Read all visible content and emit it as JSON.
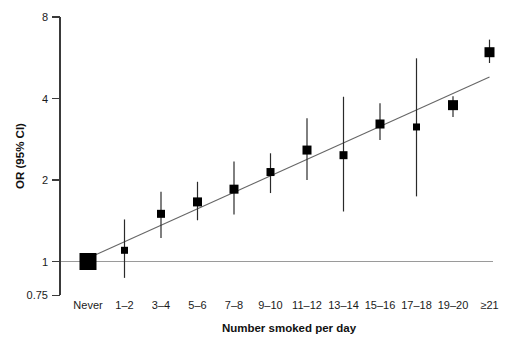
{
  "chart_data": {
    "type": "scatter",
    "subtype": "forest-plot",
    "title": "",
    "xlabel": "Number smoked per day",
    "ylabel": "OR (95% CI)",
    "y_scale": "log",
    "ylim": [
      0.75,
      8
    ],
    "y_ticks": [
      8,
      4,
      2,
      1,
      0.75
    ],
    "y_tick_labels": [
      "8",
      "4",
      "2",
      "1",
      "0.75"
    ],
    "grid": false,
    "legend": false,
    "categories": [
      "Never",
      "1–2",
      "3–4",
      "5–6",
      "7–8",
      "9–10",
      "11–12",
      "13–14",
      "15–16",
      "17–18",
      "19–20",
      "≥21"
    ],
    "points": [
      {
        "category": "Never",
        "or": 1.0,
        "ci_low": null,
        "ci_high": null,
        "marker_px": 17
      },
      {
        "category": "1–2",
        "or": 1.1,
        "ci_low": 0.87,
        "ci_high": 1.43,
        "marker_px": 7
      },
      {
        "category": "3–4",
        "or": 1.5,
        "ci_low": 1.22,
        "ci_high": 1.81,
        "marker_px": 8
      },
      {
        "category": "5–6",
        "or": 1.66,
        "ci_low": 1.42,
        "ci_high": 1.97,
        "marker_px": 9
      },
      {
        "category": "7–8",
        "or": 1.85,
        "ci_low": 1.49,
        "ci_high": 2.34,
        "marker_px": 9
      },
      {
        "category": "9–10",
        "or": 2.14,
        "ci_low": 1.79,
        "ci_high": 2.51,
        "marker_px": 8
      },
      {
        "category": "11–12",
        "or": 2.58,
        "ci_low": 2.0,
        "ci_high": 3.38,
        "marker_px": 9
      },
      {
        "category": "13–14",
        "or": 2.47,
        "ci_low": 1.53,
        "ci_high": 4.06,
        "marker_px": 8
      },
      {
        "category": "15–16",
        "or": 3.22,
        "ci_low": 2.81,
        "ci_high": 3.84,
        "marker_px": 9
      },
      {
        "category": "17–18",
        "or": 3.14,
        "ci_low": 1.74,
        "ci_high": 5.63,
        "marker_px": 7
      },
      {
        "category": "19–20",
        "or": 3.78,
        "ci_low": 3.42,
        "ci_high": 4.08,
        "marker_px": 10
      },
      {
        "category": "≥21",
        "or": 5.93,
        "ci_low": 5.41,
        "ci_high": 6.6,
        "marker_px": 10
      }
    ],
    "reference_line_or": 1.0,
    "trend_line": {
      "from_category_index": 0.15,
      "from_or": 1.05,
      "to_category_index": 11,
      "to_or": 4.8
    },
    "colors": {
      "marker": "#000000",
      "ci_line": "#2a2a2a",
      "trend_line": "#666666",
      "reference_line": "#9a9a9a",
      "axis": "#3a3a3a",
      "text": "#1a1a1a"
    }
  }
}
